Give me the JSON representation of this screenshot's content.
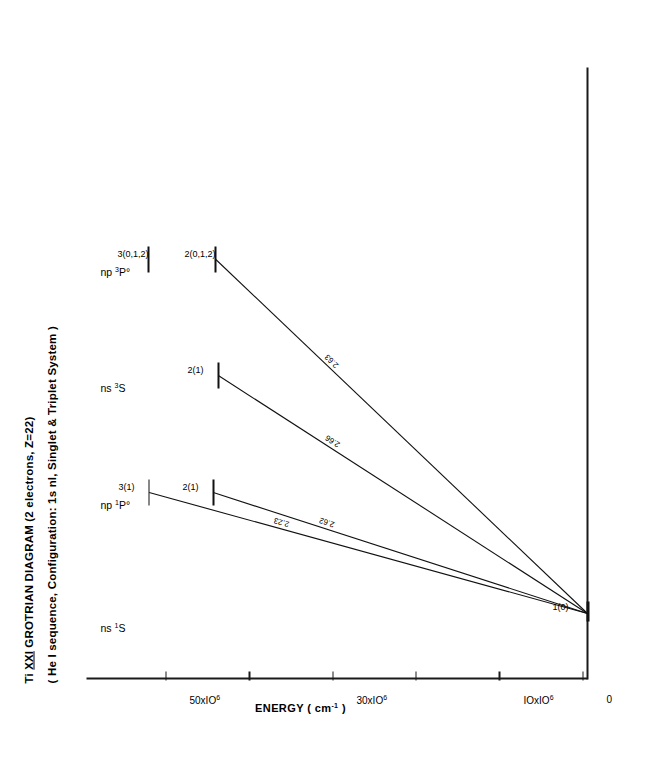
{
  "figure": {
    "title_line1_pre": "Ti ",
    "title_line1_roman": "XXI",
    "title_line1_post": "  GROTRIAN  DIAGRAM (2 electrons, Z=22)",
    "title_line2": "( He I sequence, Configuration: 1s nl, Singlet & Triplet System )",
    "y_axis_label": "ENERGY ( cm",
    "y_axis_label_sup": "-1",
    "y_axis_label_end": " )"
  },
  "chart_data": {
    "type": "diagram",
    "title": "Ti XXI GROTRIAN DIAGRAM (2 electrons, Z=22)",
    "subtitle": "( He I sequence, Configuration: 1s nl, Singlet & Triplet System )",
    "ylabel": "ENERGY ( cm-1 )",
    "ylim": [
      0,
      60000000
    ],
    "grid": false,
    "y_ticks": [
      {
        "value": 0,
        "label": "0",
        "sup": ""
      },
      {
        "value": 10000000,
        "label": "IOxIO",
        "sup": "6"
      },
      {
        "value": 20000000,
        "label": "",
        "sup": ""
      },
      {
        "value": 30000000,
        "label": "30xIO",
        "sup": "6"
      },
      {
        "value": 40000000,
        "label": "",
        "sup": ""
      },
      {
        "value": 50000000,
        "label": "50xIO",
        "sup": "6"
      }
    ],
    "columns": [
      {
        "id": "ns1S",
        "head_pre": "ns ",
        "head_sup": "1",
        "head_post": "S"
      },
      {
        "id": "np1Po",
        "head_pre": "np ",
        "head_sup": "1",
        "head_post": "P°"
      },
      {
        "id": "ns3S",
        "head_pre": "ns ",
        "head_sup": "3",
        "head_post": "S"
      },
      {
        "id": "np3Po",
        "head_pre": "np ",
        "head_sup": "3",
        "head_post": "P°"
      }
    ],
    "levels": [
      {
        "id": "g",
        "column": "ns1S",
        "label": "1(0)",
        "energy": 0
      },
      {
        "id": "p1_2",
        "column": "np1Po",
        "label": "2(1)",
        "energy": 44900000
      },
      {
        "id": "p1_3",
        "column": "np1Po",
        "label": "3(1)",
        "energy": 52600000
      },
      {
        "id": "s3_2",
        "column": "ns3S",
        "label": "2(1)",
        "energy": 44300000
      },
      {
        "id": "p3_2",
        "column": "np3Po",
        "label": "2(0,1,2)",
        "energy": 44600000
      },
      {
        "id": "p3_3",
        "column": "np3Po",
        "label": "3(0,1,2)",
        "energy": 52700000
      }
    ],
    "transitions": [
      {
        "from": "p1_3",
        "to": "g",
        "wavelength": "2.23"
      },
      {
        "from": "p1_2",
        "to": "g",
        "wavelength": "2.62"
      },
      {
        "from": "s3_2",
        "to": "g",
        "wavelength": "2.66"
      },
      {
        "from": "p3_2",
        "to": "g",
        "wavelength": "2.63"
      }
    ]
  }
}
